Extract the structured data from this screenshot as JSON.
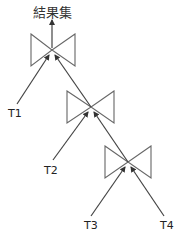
{
  "diagram": {
    "type": "join-tree",
    "result_label": "結果集",
    "operator_shape": "bowtie",
    "line_color": "#444444",
    "shape_color": "#666666",
    "joins": [
      {
        "id": "join-top",
        "center": [
          52,
          50
        ],
        "inputs": [
          "T1",
          "join-middle"
        ]
      },
      {
        "id": "join-middle",
        "center": [
          91,
          107
        ],
        "inputs": [
          "T2",
          "join-bottom"
        ]
      },
      {
        "id": "join-bottom",
        "center": [
          128,
          162
        ],
        "inputs": [
          "T3",
          "T4"
        ]
      }
    ],
    "tables": [
      {
        "label": "T1"
      },
      {
        "label": "T2"
      },
      {
        "label": "T3"
      },
      {
        "label": "T4"
      }
    ]
  }
}
